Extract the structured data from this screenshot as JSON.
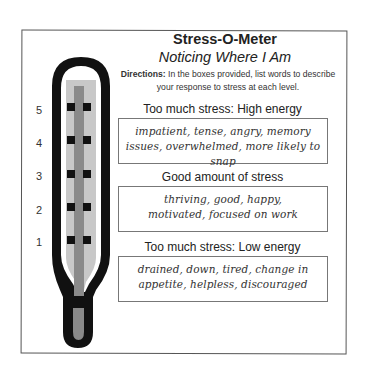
{
  "document": {
    "title": "Stress-O-Meter",
    "subtitle": "Noticing Where I Am",
    "directions_label": "Directions:",
    "directions_text": " In the boxes provided, list words to describe your response to stress at each level."
  },
  "thermometer": {
    "levels": [
      "5",
      "4",
      "3",
      "2",
      "1"
    ],
    "colors": {
      "outline": "#111111",
      "inner_fill": "#c8c8c8",
      "stem": "#8a8a8a",
      "markers": "#111111"
    }
  },
  "sections": [
    {
      "heading": "Too much stress: High energy",
      "response": "impatient, tense, angry, memory issues, overwhelmed, more likely to snap"
    },
    {
      "heading": "Good amount of stress",
      "response": "thriving, good, happy, motivated, focused on work"
    },
    {
      "heading": "Too much stress: Low energy",
      "response": "drained, down, tired, change in appetite, helpless, discouraged"
    }
  ]
}
